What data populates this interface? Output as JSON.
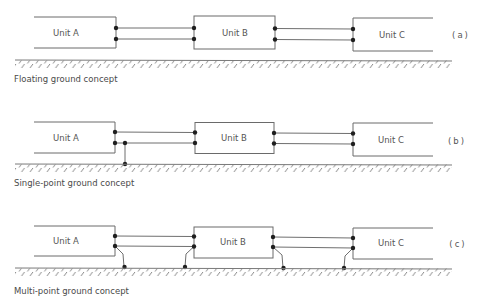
{
  "figure": {
    "panels": [
      {
        "label": "(a)",
        "caption": "Floating ground concept",
        "grounding": "floating",
        "units": [
          "Unit A",
          "Unit B",
          "Unit C"
        ]
      },
      {
        "label": "(b)",
        "caption": "Single-point ground concept",
        "grounding": "single-point",
        "units": [
          "Unit A",
          "Unit B",
          "Unit C"
        ]
      },
      {
        "label": "(c)",
        "caption": "Multi-point ground concept",
        "grounding": "multi-point",
        "units": [
          "Unit A",
          "Unit B",
          "Unit C"
        ]
      }
    ]
  },
  "colors": {
    "line": "#6a6a6a",
    "dot": "#1e1e1e",
    "text": "#555555"
  }
}
